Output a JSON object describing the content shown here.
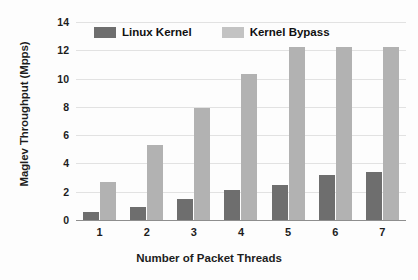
{
  "chart_data": {
    "type": "bar",
    "title": "",
    "xlabel": "Number of Packet Threads",
    "ylabel": "Maglev Throughput (Mpps)",
    "categories": [
      "1",
      "2",
      "3",
      "4",
      "5",
      "6",
      "7"
    ],
    "series": [
      {
        "name": "Linux Kernel",
        "color": "#6e6e6e",
        "values": [
          0.6,
          0.9,
          1.5,
          2.1,
          2.5,
          3.2,
          3.4
        ]
      },
      {
        "name": "Kernel Bypass",
        "color": "#b2b2b2",
        "values": [
          2.7,
          5.3,
          7.9,
          10.3,
          12.2,
          12.2,
          12.2
        ]
      }
    ],
    "ylim": [
      0,
      14
    ],
    "yticks": [
      0,
      2,
      4,
      6,
      8,
      10,
      12,
      14
    ],
    "ytick_labels": [
      "0",
      "2",
      "4",
      "6",
      "8",
      "10",
      "12",
      "14"
    ],
    "grid": true,
    "legend_position": "top-inside"
  }
}
